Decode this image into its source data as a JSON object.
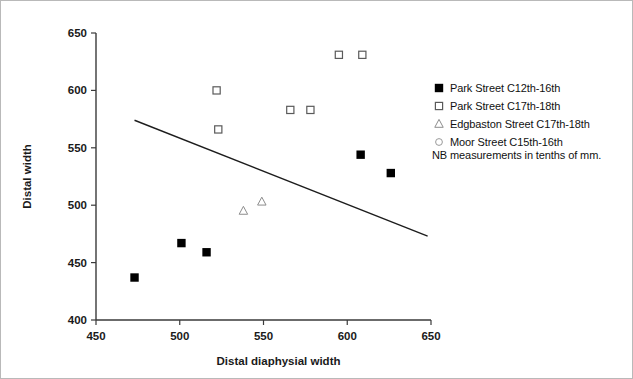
{
  "chart_data": {
    "type": "scatter",
    "title": "",
    "xlabel": "Distal diaphysial width",
    "ylabel": "Distal width",
    "xlim": [
      450,
      650
    ],
    "ylim": [
      400,
      650
    ],
    "xticks": [
      450,
      500,
      550,
      600,
      650
    ],
    "yticks": [
      400,
      450,
      500,
      550,
      600,
      650
    ],
    "grid": false,
    "note": "NB measurements in tenths of mm.",
    "legend_position": "right",
    "series": [
      {
        "name": "Park Street C12th-16th",
        "marker": "filled-square",
        "points": [
          {
            "x": 473,
            "y": 437
          },
          {
            "x": 501,
            "y": 467
          },
          {
            "x": 516,
            "y": 459
          },
          {
            "x": 608,
            "y": 544
          },
          {
            "x": 626,
            "y": 528
          }
        ]
      },
      {
        "name": "Park Street C17th-18th",
        "marker": "open-square",
        "points": [
          {
            "x": 522,
            "y": 600
          },
          {
            "x": 523,
            "y": 566
          },
          {
            "x": 566,
            "y": 583
          },
          {
            "x": 578,
            "y": 583
          },
          {
            "x": 595,
            "y": 631
          },
          {
            "x": 609,
            "y": 631
          }
        ]
      },
      {
        "name": "Edgbaston Street C17th-18th",
        "marker": "open-triangle",
        "points": [
          {
            "x": 538,
            "y": 495
          },
          {
            "x": 549,
            "y": 503
          }
        ]
      },
      {
        "name": "Moor Street C15th-16th",
        "marker": "open-circle",
        "points": []
      }
    ],
    "trend_line": {
      "x1": 473,
      "y1": 574,
      "x2": 648,
      "y2": 473
    }
  },
  "axes": {
    "x_title": "Distal diaphysial width",
    "y_title": "Distal width",
    "x_tick_labels": [
      "450",
      "500",
      "550",
      "600",
      "650"
    ],
    "y_tick_labels": [
      "400",
      "450",
      "500",
      "550",
      "600",
      "650"
    ]
  },
  "legend": {
    "entries": [
      {
        "label": "Park Street C12th-16th",
        "marker": "filled-square"
      },
      {
        "label": "Park Street C17th-18th",
        "marker": "open-square"
      },
      {
        "label": "Edgbaston Street C17th-18th",
        "marker": "open-triangle"
      },
      {
        "label": "Moor Street C15th-16th",
        "marker": "open-circle"
      }
    ],
    "note": "NB measurements in tenths of mm."
  }
}
